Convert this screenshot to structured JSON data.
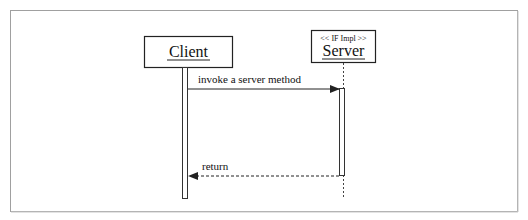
{
  "diagram": {
    "type": "sequence",
    "frame_color": "#9a9a9a",
    "line_color": "#333333",
    "participants": [
      {
        "id": "client",
        "name": "Client",
        "stereotype": ""
      },
      {
        "id": "server",
        "name": "Server",
        "stereotype": "<< IF Impl >>"
      }
    ],
    "messages": [
      {
        "from": "client",
        "to": "server",
        "label": "invoke a server method",
        "style": "solid"
      },
      {
        "from": "server",
        "to": "client",
        "label": "return",
        "style": "dashed"
      }
    ]
  }
}
